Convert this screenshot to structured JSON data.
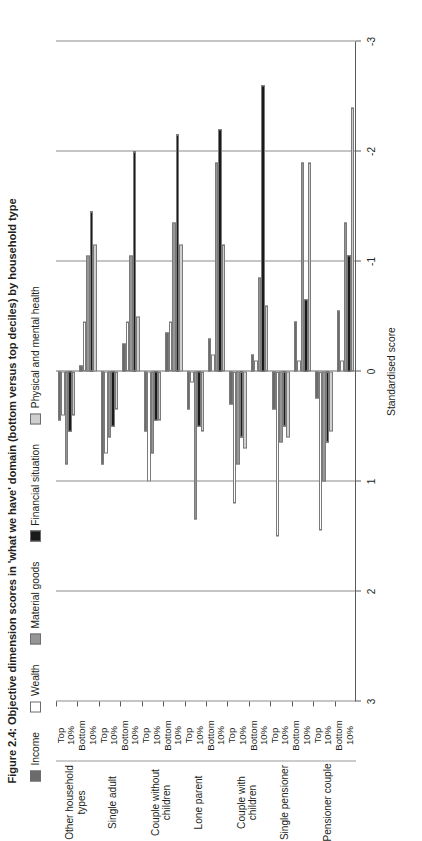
{
  "figure": {
    "title": "Figure 2.4: Objective dimension scores in 'what we have' domain (bottom versus top deciles) by household type"
  },
  "legend": {
    "position": "top",
    "items": [
      {
        "label": "Income",
        "color": "#6b6b6b"
      },
      {
        "label": "Wealth",
        "color": "#ffffff"
      },
      {
        "label": "Material goods",
        "color": "#969696"
      },
      {
        "label": "Financial situation",
        "color": "#1a1a1a"
      },
      {
        "label": "Physical and mental health",
        "color": "#cfcfcf"
      }
    ]
  },
  "axis": {
    "value_axis_title": "Standardised score",
    "ticks": [
      "3",
      "2",
      "1",
      "0",
      "-1",
      "-2",
      "-3"
    ],
    "tick_values": [
      3,
      2,
      1,
      0,
      -1,
      -2,
      -3
    ],
    "limits": [
      -3,
      3
    ],
    "grid": true
  },
  "categories": {
    "decile_labels": [
      "Bottom\n10%",
      "Top\n10%"
    ],
    "decile_label_bottom": "Bottom 10%",
    "decile_label_top": "Top 10%",
    "groups": [
      "Pensioner couple",
      "Single pensioner",
      "Couple with children",
      "Lone parent",
      "Couple without children",
      "Single adult",
      "Other household types"
    ]
  },
  "chart_data": {
    "type": "bar",
    "orientation": "horizontal",
    "title": "Figure 2.4: Objective dimension scores in 'what we have' domain (bottom versus top deciles) by household type",
    "xlabel": "Standardised score",
    "ylabel": "",
    "xlim": [
      -3,
      3
    ],
    "grid": true,
    "legend_position": "top",
    "categories": [
      "Pensioner couple - Bottom 10%",
      "Pensioner couple - Top 10%",
      "Single pensioner - Bottom 10%",
      "Single pensioner - Top 10%",
      "Couple with children - Bottom 10%",
      "Couple with children - Top 10%",
      "Lone parent - Bottom 10%",
      "Lone parent - Top 10%",
      "Couple without children - Bottom 10%",
      "Couple without children - Top 10%",
      "Single adult - Bottom 10%",
      "Single adult - Top 10%",
      "Other household types - Bottom 10%",
      "Other household types - Top 10%"
    ],
    "series": [
      {
        "name": "Income",
        "color": "#6b6b6b",
        "values": [
          -0.55,
          0.25,
          -0.45,
          0.35,
          -0.15,
          0.3,
          -0.3,
          0.35,
          -0.35,
          0.55,
          -0.25,
          0.85,
          -0.05,
          0.45
        ]
      },
      {
        "name": "Wealth",
        "color": "#ffffff",
        "values": [
          -0.1,
          1.45,
          -0.1,
          1.5,
          -0.1,
          1.2,
          -0.15,
          0.1,
          -0.45,
          1.0,
          -0.45,
          0.75,
          -0.45,
          0.4
        ]
      },
      {
        "name": "Material goods",
        "color": "#969696",
        "values": [
          -1.35,
          1.0,
          -1.9,
          0.65,
          -0.85,
          0.85,
          -1.9,
          1.35,
          -1.35,
          0.75,
          -1.05,
          0.6,
          -1.05,
          0.85
        ]
      },
      {
        "name": "Financial situation",
        "color": "#1a1a1a",
        "values": [
          -1.05,
          0.65,
          -0.65,
          0.5,
          -2.6,
          0.6,
          -2.2,
          0.5,
          -2.15,
          0.45,
          -2.0,
          0.5,
          -1.45,
          0.55
        ]
      },
      {
        "name": "Physical and mental health",
        "color": "#cfcfcf",
        "values": [
          -2.4,
          0.55,
          -1.9,
          0.6,
          -0.6,
          0.7,
          -1.15,
          0.55,
          -1.15,
          0.45,
          -0.5,
          0.35,
          -1.15,
          0.4
        ]
      }
    ]
  }
}
